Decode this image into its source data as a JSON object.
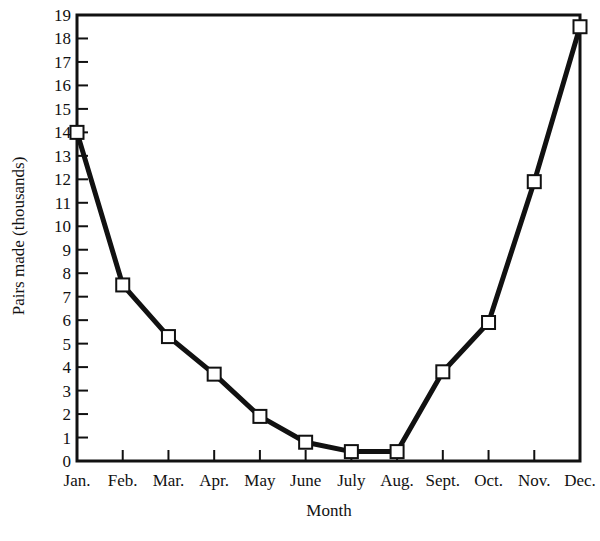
{
  "chart_data": {
    "type": "line",
    "title": "",
    "xlabel": "Month",
    "ylabel": "Pairs made (thousands)",
    "categories": [
      "Jan.",
      "Feb.",
      "Mar.",
      "Apr.",
      "May",
      "June",
      "July",
      "Aug.",
      "Sept.",
      "Oct.",
      "Nov.",
      "Dec."
    ],
    "series": [
      {
        "name": "Pairs made",
        "values": [
          14.0,
          7.5,
          5.3,
          3.7,
          1.9,
          0.8,
          0.4,
          0.4,
          3.8,
          5.9,
          11.9,
          18.5
        ],
        "marker": "open-square",
        "color": "#111111"
      }
    ],
    "ylim": [
      0,
      19
    ],
    "yticks": [
      0,
      1,
      2,
      3,
      4,
      5,
      6,
      7,
      8,
      9,
      10,
      11,
      12,
      13,
      14,
      15,
      16,
      17,
      18,
      19
    ],
    "grid": false,
    "legend": "none"
  }
}
